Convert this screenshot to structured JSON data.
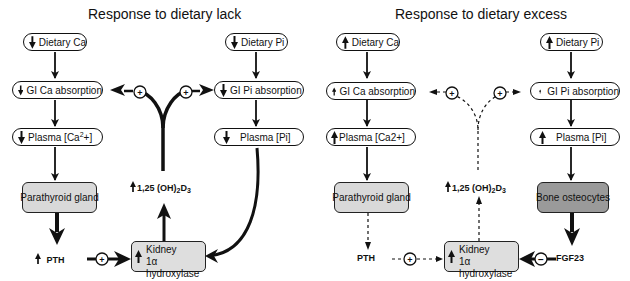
{
  "panels": {
    "lack": {
      "title": "Response to dietary lack",
      "dietary_ca": {
        "direction": "down",
        "label": "Dietary Ca"
      },
      "dietary_pi": {
        "direction": "down",
        "label": "Dietary Pi"
      },
      "gi_ca": {
        "direction": "down",
        "label": "GI Ca absorption"
      },
      "gi_pi": {
        "direction": "down",
        "label": "GI Pi absorption"
      },
      "plasma_ca": {
        "direction": "down",
        "label_prefix": "Plasma [Ca",
        "label_sup": "2",
        "label_suffix": "+]"
      },
      "plasma_pi": {
        "direction": "down",
        "label": "Plasma [Pi]"
      },
      "parathyroid": {
        "label": "Parathyroid gland"
      },
      "pth": {
        "direction": "up",
        "label": "PTH"
      },
      "vitd": {
        "direction": "up",
        "label_main": "1,25 (OH)",
        "sub1": "2",
        "label_d": "D",
        "sub2": "3"
      },
      "kidney": {
        "direction": "up",
        "line1": "Kidney",
        "line2": "1α hydroxylase"
      },
      "pth_to_kidney_sign": "+",
      "vitd_to_gi_ca_sign": "+",
      "vitd_to_gi_pi_sign": "+",
      "line_style": "solid"
    },
    "excess": {
      "title": "Response to dietary excess",
      "dietary_ca": {
        "direction": "up",
        "label": "Dietary Ca"
      },
      "dietary_pi": {
        "direction": "up",
        "label": "Dietary Pi"
      },
      "gi_ca": {
        "direction": "up",
        "label": "GI Ca absorption"
      },
      "gi_pi": {
        "direction": "up",
        "label": "GI Pi absorption"
      },
      "plasma_ca": {
        "direction": "up",
        "label": "Plasma [Ca2+]"
      },
      "plasma_pi": {
        "direction": "up",
        "label": "Plasma [Pi]"
      },
      "parathyroid": {
        "label": "Parathyroid gland"
      },
      "bone": {
        "label": "Bone osteocytes"
      },
      "pth": {
        "label": "PTH"
      },
      "fgf23": {
        "label": "FGF23"
      },
      "vitd": {
        "direction": "up",
        "label_main": "1,25 (OH)",
        "sub1": "2",
        "label_d": "D",
        "sub2": "3"
      },
      "kidney": {
        "direction": "up",
        "line1": "Kidney",
        "line2": "1α hydroxylase"
      },
      "pth_to_kidney_sign": "+",
      "fgf23_to_kidney_sign": "−",
      "vitd_to_gi_ca_sign": "+",
      "vitd_to_gi_pi_sign": "+",
      "line_style": "dashed (reduced)"
    }
  },
  "colors": {
    "stroke": "#111111",
    "box_light": "#d9d9d9",
    "box_dark": "#9a9a9a",
    "kidney_fill": "#dedede"
  },
  "icons": {
    "up": "arrow-up-icon",
    "down": "arrow-down-icon",
    "plus": "plus-circle-icon",
    "minus": "minus-circle-icon"
  }
}
